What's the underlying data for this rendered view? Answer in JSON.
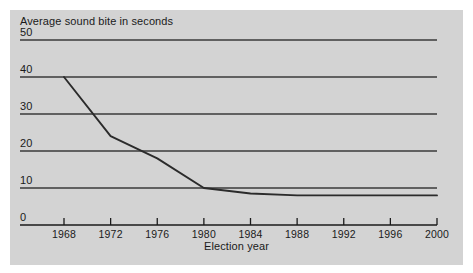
{
  "chart_data": {
    "type": "line",
    "title": "Average sound bite in seconds",
    "xlabel": "Election year",
    "ylabel": "",
    "x": [
      1968,
      1972,
      1976,
      1980,
      1984,
      1988,
      1992,
      1996,
      2000
    ],
    "values": [
      40,
      24,
      18,
      10,
      8.5,
      8,
      8,
      8,
      8
    ],
    "series": [
      {
        "name": "Average sound bite in seconds",
        "values": [
          40,
          24,
          18,
          10,
          8.5,
          8,
          8,
          8,
          8
        ]
      }
    ],
    "categories": [
      "1968",
      "1972",
      "1976",
      "1980",
      "1984",
      "1988",
      "1992",
      "1996",
      "2000"
    ],
    "xlim": [
      1968,
      2000
    ],
    "ylim": [
      0,
      50
    ],
    "yticks": [
      0,
      10,
      20,
      30,
      40,
      50
    ],
    "ytick_labels": [
      "0",
      "10",
      "20",
      "30",
      "40",
      "50"
    ],
    "xticks": [
      1968,
      1972,
      1976,
      1980,
      1984,
      1988,
      1992,
      1996,
      2000
    ],
    "xtick_labels": [
      "1968",
      "1972",
      "1976",
      "1980",
      "1984",
      "1988",
      "1992",
      "1996",
      "2000"
    ],
    "grid": true,
    "grid_axis": "y",
    "legend": false,
    "legend_position": "none",
    "line_color": "#2b2b2b",
    "grid_color": "#3a3a3a",
    "axis_color": "#1a1a1a",
    "background_color": "#d3d3d3",
    "page_background_color": "#ffffff"
  }
}
